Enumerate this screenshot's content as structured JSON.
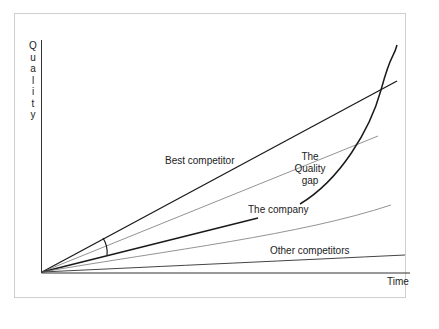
{
  "diagram": {
    "y_axis_label": "Quality",
    "y_axis_letters": [
      "Q",
      "u",
      "a",
      "l",
      "i",
      "t",
      "y"
    ],
    "x_axis_label": "Time",
    "labels": {
      "best_competitor": "Best competitor",
      "quality_gap_line1": "The",
      "quality_gap_line2": "Quality",
      "quality_gap_line3": "gap",
      "the_company": "The company",
      "other_competitors": "Other competitors"
    },
    "colors": {
      "line_dark": "#1a1a1a",
      "line_light": "#777777",
      "frame": "#cfcfcf"
    }
  }
}
